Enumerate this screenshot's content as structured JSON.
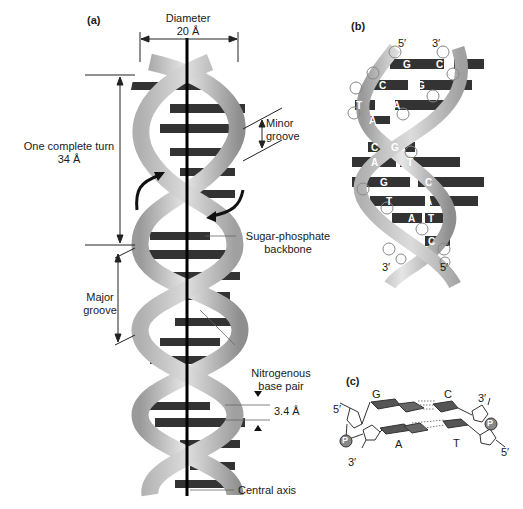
{
  "panels": {
    "a": {
      "label": "(a)",
      "diameter": {
        "title": "Diameter",
        "value": "20 Å"
      },
      "turn": {
        "title": "One complete turn",
        "value": "34 Å"
      },
      "minor_groove": {
        "line1": "Minor",
        "line2": "groove"
      },
      "major_groove": {
        "line1": "Major",
        "line2": "groove"
      },
      "backbone": {
        "line1": "Sugar-phosphate",
        "line2": "backbone"
      },
      "base_pair": {
        "line1": "Nitrogenous",
        "line2": "base pair"
      },
      "rise": "3.4 Å",
      "axis": "Central axis"
    },
    "b": {
      "label": "(b)",
      "top_left": "5′",
      "top_right": "3′",
      "bottom_left": "3′",
      "bottom_right": "5′",
      "pairs": [
        {
          "left": "G",
          "right": "C"
        },
        {
          "left": "C",
          "right": "G"
        },
        {
          "left": "T",
          "right": "A"
        },
        {
          "left": "A",
          "right": ""
        },
        {
          "left": "C",
          "right": "G"
        },
        {
          "left": "A",
          "right": "T"
        },
        {
          "left": "G",
          "right": "C"
        },
        {
          "left": "T",
          "right": "A"
        },
        {
          "left": "A",
          "right": "T"
        },
        {
          "left": "",
          "right": "C"
        }
      ]
    },
    "c": {
      "label": "(c)",
      "top_pair": {
        "left": "G",
        "right": "C"
      },
      "bottom_pair": {
        "left": "A",
        "right": "T"
      },
      "top_left_end": "5′",
      "top_right_end": "3′",
      "bottom_left_end": "3′",
      "bottom_right_end": "5′",
      "phosphate": "P"
    }
  },
  "colors": {
    "ribbon_light": "#d9d9d9",
    "ribbon_dark": "#8a8a8a",
    "base_dark": "#2e2e2e",
    "axis": "#000000",
    "text": "#1a1a1a"
  }
}
